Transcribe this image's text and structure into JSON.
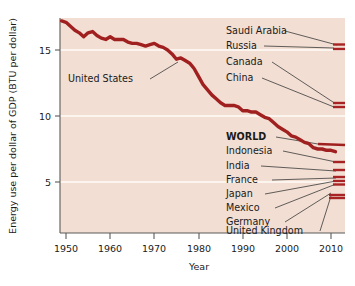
{
  "chart_data": {
    "type": "line",
    "title": "",
    "xlabel": "Year",
    "ylabel": "Energy use per dollar of GDP (BTU per dollar)",
    "xlim": [
      1948,
      2012
    ],
    "ylim": [
      0,
      18.2
    ],
    "xticks": [
      1950,
      1960,
      1970,
      1980,
      1990,
      2000,
      2010
    ],
    "yticks": [
      5,
      10,
      15
    ],
    "grid": "horizontal-white-faint",
    "legend_position": "inline-right-labels",
    "plot_background": "#f2ded2",
    "line_color": "#a02020",
    "annotations": [
      {
        "text": "United States",
        "x": 1964,
        "y": 12.9,
        "leader_to_x": 1977,
        "leader_to_y": 14.3
      }
    ],
    "series": [
      {
        "name": "United States",
        "emphasis": "main",
        "label_inline": "United States",
        "end_value": 7.3,
        "x": [
          1949,
          1950,
          1951,
          1952,
          1953,
          1954,
          1955,
          1956,
          1957,
          1958,
          1959,
          1960,
          1961,
          1962,
          1963,
          1964,
          1965,
          1966,
          1967,
          1968,
          1969,
          1970,
          1971,
          1972,
          1973,
          1974,
          1975,
          1976,
          1977,
          1978,
          1979,
          1980,
          1981,
          1982,
          1983,
          1984,
          1985,
          1986,
          1987,
          1988,
          1989,
          1990,
          1991,
          1992,
          1993,
          1994,
          1995,
          1996,
          1997,
          1998,
          1999,
          2000,
          2001,
          2002,
          2003,
          2004,
          2005,
          2006,
          2007,
          2008,
          2009,
          2010,
          2011
        ],
        "y": [
          17.2,
          17.1,
          16.8,
          16.5,
          16.3,
          16.0,
          16.3,
          16.4,
          16.1,
          15.9,
          15.8,
          16.0,
          15.8,
          15.8,
          15.8,
          15.6,
          15.5,
          15.5,
          15.4,
          15.3,
          15.4,
          15.5,
          15.3,
          15.2,
          15.0,
          14.7,
          14.3,
          14.4,
          14.2,
          14.0,
          13.6,
          13.0,
          12.4,
          12.0,
          11.6,
          11.3,
          11.0,
          10.8,
          10.8,
          10.8,
          10.7,
          10.4,
          10.4,
          10.3,
          10.3,
          10.1,
          9.9,
          9.8,
          9.5,
          9.2,
          9.0,
          8.8,
          8.5,
          8.4,
          8.2,
          8.0,
          7.9,
          7.6,
          7.5,
          7.5,
          7.4,
          7.4,
          7.3
        ]
      },
      {
        "name": "Saudi Arabia",
        "end_value": 14.8,
        "label_y": 14.8
      },
      {
        "name": "Russia",
        "end_value": 14.4,
        "label_y": 14.4
      },
      {
        "name": "Canada",
        "end_value": 10.6,
        "label_y": 10.6
      },
      {
        "name": "China",
        "end_value": 10.3,
        "label_y": 10.3
      },
      {
        "name": "WORLD",
        "end_value": 7.3,
        "label_y": 7.3,
        "emphasis": "bold"
      },
      {
        "name": "Indonesia",
        "end_value": 6.2,
        "label_y": 6.2
      },
      {
        "name": "India",
        "end_value": 5.6,
        "label_y": 5.6
      },
      {
        "name": "France",
        "end_value": 5.3,
        "label_y": 5.3
      },
      {
        "name": "Japan",
        "end_value": 5.1,
        "label_y": 5.1
      },
      {
        "name": "Mexico",
        "end_value": 4.9,
        "label_y": 4.9
      },
      {
        "name": "Germany",
        "end_value": 4.1,
        "label_y": 4.1
      },
      {
        "name": "United Kingdom",
        "end_value": 4.0,
        "label_y": 4.0
      }
    ]
  },
  "axis": {
    "y_title": "Energy use per dollar of GDP (BTU per dollar)",
    "x_title": "Year",
    "y_ticks": [
      "15",
      "10",
      "5"
    ],
    "x_ticks": [
      "1950",
      "1960",
      "1970",
      "1980",
      "1990",
      "2000",
      "2010"
    ]
  },
  "labels": {
    "united_states": "United States",
    "saudi_arabia": "Saudi Arabia",
    "russia": "Russia",
    "canada": "Canada",
    "china": "China",
    "world": "WORLD",
    "indonesia": "Indonesia",
    "india": "India",
    "france": "France",
    "japan": "Japan",
    "mexico": "Mexico",
    "germany": "Germany",
    "united_kingdom": "United Kingdom"
  },
  "colors": {
    "plot_bg": "#f2ded2",
    "line": "#a02020",
    "axis": "#5a5a5a",
    "grid": "#fbf1ea",
    "text": "#1a1a1a"
  }
}
